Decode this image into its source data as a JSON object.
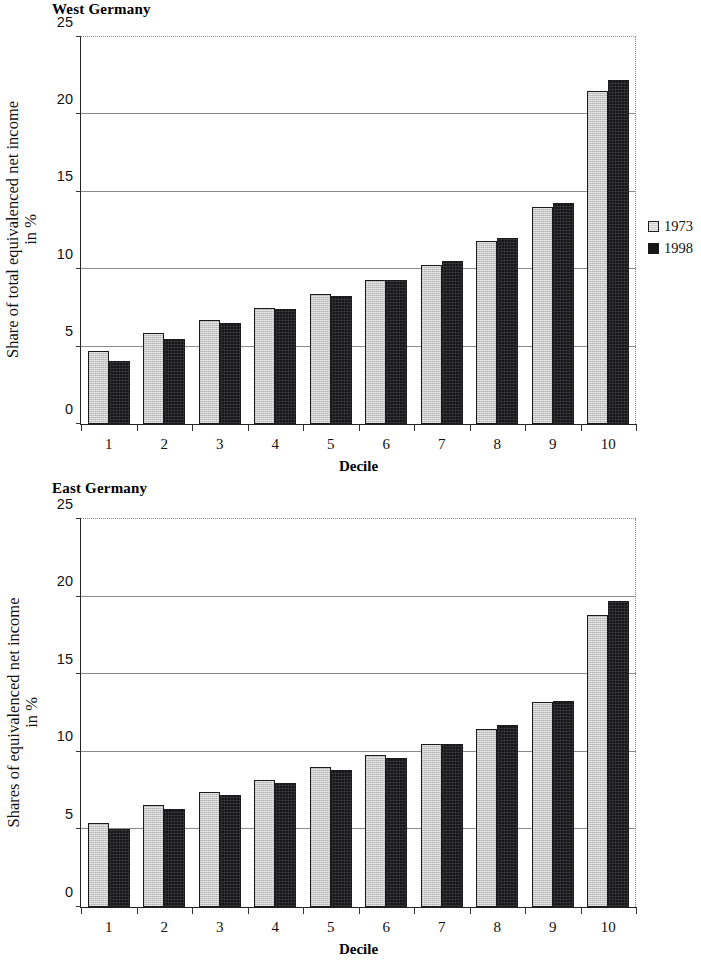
{
  "page": {
    "charts": [
      {
        "id": "west",
        "title": "West Germany",
        "ylabel_line1": "Share of total equivalenced net income",
        "ylabel_line2": "in %",
        "xlabel": "Decile",
        "legend": [
          {
            "label": "1973",
            "style": "light"
          },
          {
            "label": "1998",
            "style": "dark"
          }
        ],
        "yticks": [
          "0",
          "5",
          "10",
          "15",
          "20",
          "25"
        ]
      },
      {
        "id": "east",
        "title": "East Germany",
        "ylabel_line1": "Shares of equivalenced net income",
        "ylabel_line2": "in %",
        "xlabel": "Decile",
        "legend": [
          {
            "label": "1993",
            "style": "light"
          },
          {
            "label": "1998",
            "style": "dark"
          }
        ],
        "yticks": [
          "0",
          "5",
          "10",
          "15",
          "20",
          "25"
        ]
      }
    ]
  },
  "chart_data": [
    {
      "type": "bar",
      "title": "West Germany",
      "xlabel": "Decile",
      "ylabel": "Share of total equivalenced net income in %",
      "categories": [
        "1",
        "2",
        "3",
        "4",
        "5",
        "6",
        "7",
        "8",
        "9",
        "10"
      ],
      "ylim": [
        0,
        25
      ],
      "yticks": [
        0,
        5,
        10,
        15,
        20,
        25
      ],
      "grid": true,
      "legend_position": "right",
      "colors": {
        "light": "#c9c9c9",
        "dark": "#17171a"
      },
      "series": [
        {
          "name": "1973",
          "style": "light",
          "values": [
            4.7,
            5.9,
            6.7,
            7.5,
            8.4,
            9.3,
            10.3,
            11.8,
            14.0,
            21.5
          ]
        },
        {
          "name": "1998",
          "style": "dark",
          "values": [
            4.1,
            5.5,
            6.5,
            7.4,
            8.3,
            9.3,
            10.5,
            12.0,
            14.3,
            22.2
          ]
        }
      ]
    },
    {
      "type": "bar",
      "title": "East Germany",
      "xlabel": "Decile",
      "ylabel": "Shares of equivalenced net income in %",
      "categories": [
        "1",
        "2",
        "3",
        "4",
        "5",
        "6",
        "7",
        "8",
        "9",
        "10"
      ],
      "ylim": [
        0,
        25
      ],
      "yticks": [
        0,
        5,
        10,
        15,
        20,
        25
      ],
      "grid": true,
      "legend_position": "right",
      "colors": {
        "light": "#c9c9c9",
        "dark": "#17171a"
      },
      "series": [
        {
          "name": "1993",
          "style": "light",
          "values": [
            5.4,
            6.6,
            7.4,
            8.2,
            9.0,
            9.8,
            10.5,
            11.5,
            13.2,
            18.8
          ]
        },
        {
          "name": "1998",
          "style": "dark",
          "values": [
            5.0,
            6.3,
            7.2,
            8.0,
            8.8,
            9.6,
            10.5,
            11.7,
            13.3,
            19.7
          ]
        }
      ]
    }
  ]
}
